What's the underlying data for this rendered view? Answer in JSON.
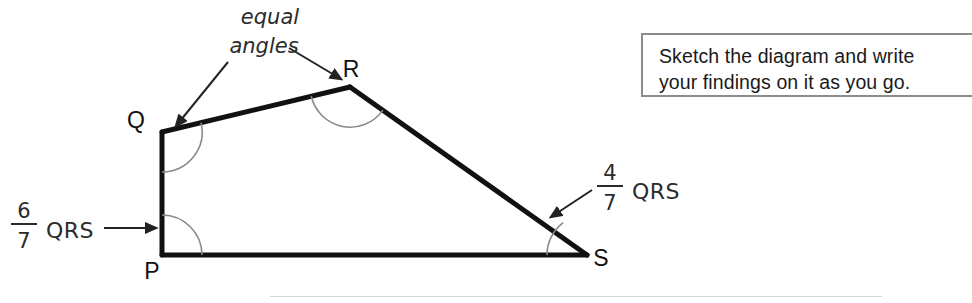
{
  "callout": {
    "line1": "Sketch the diagram and write",
    "line2": "your findings on it as you go."
  },
  "diagram": {
    "vertices": {
      "P": {
        "label": "P",
        "x": 162,
        "y": 255,
        "label_x": 152,
        "label_y": 279
      },
      "Q": {
        "label": "Q",
        "x": 162,
        "y": 132,
        "label_x": 136,
        "label_y": 128
      },
      "R": {
        "label": "R",
        "x": 350,
        "y": 87,
        "label_x": 347,
        "label_y": 77
      },
      "S": {
        "label": "S",
        "x": 587,
        "y": 255,
        "label_x": 595,
        "label_y": 266
      }
    },
    "annotations": {
      "equal_angles_line1": "equal",
      "equal_angles_line2": "angles",
      "left_fraction_numerator": "6",
      "left_fraction_denominator": "7",
      "left_fraction_subject": "QRS",
      "right_fraction_numerator": "4",
      "right_fraction_denominator": "7",
      "right_fraction_subject": "QRS"
    },
    "colors": {
      "edge": "#111111",
      "arc": "#8a8a8a",
      "annotation": "#222222",
      "callout_border": "#8c8c8c",
      "background": "#ffffff",
      "rule": "#d6d6d6"
    }
  }
}
